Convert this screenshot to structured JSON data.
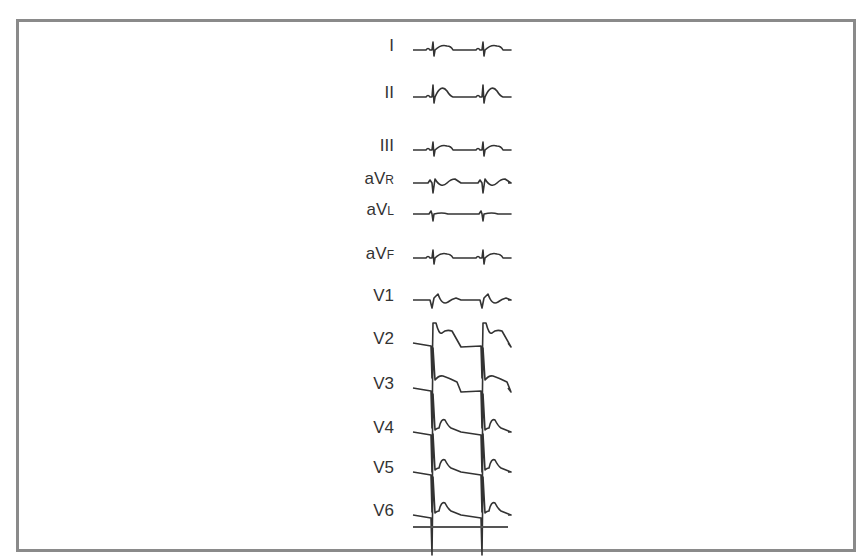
{
  "figure": {
    "type": "12-lead ECG",
    "leads": [
      {
        "id": "I",
        "main": "I",
        "sub": "",
        "baseline_y": 50,
        "morph": "upright_small"
      },
      {
        "id": "II",
        "main": "II",
        "sub": "",
        "baseline_y": 97,
        "morph": "upright_peakT"
      },
      {
        "id": "III",
        "main": "III",
        "sub": "",
        "baseline_y": 150,
        "morph": "upright_small"
      },
      {
        "id": "aVR",
        "main": "aV",
        "sub": "R",
        "baseline_y": 183,
        "morph": "inverted"
      },
      {
        "id": "aVL",
        "main": "aV",
        "sub": "L",
        "baseline_y": 214,
        "morph": "flat"
      },
      {
        "id": "aVF",
        "main": "aV",
        "sub": "F",
        "baseline_y": 258,
        "morph": "upright_small"
      },
      {
        "id": "V1",
        "main": "V1",
        "sub": "",
        "baseline_y": 300,
        "morph": "v1"
      },
      {
        "id": "V2",
        "main": "V2",
        "sub": "",
        "baseline_y": 343,
        "morph": "v2"
      },
      {
        "id": "V3",
        "main": "V3",
        "sub": "",
        "baseline_y": 388,
        "morph": "v3"
      },
      {
        "id": "V4",
        "main": "V4",
        "sub": "",
        "baseline_y": 432,
        "morph": "vT"
      },
      {
        "id": "V5",
        "main": "V5",
        "sub": "",
        "baseline_y": 472,
        "morph": "vT"
      },
      {
        "id": "V6",
        "main": "V6",
        "sub": "",
        "baseline_y": 515,
        "morph": "vT"
      }
    ],
    "trace": {
      "x_start": 413,
      "x_end": 508,
      "beat1_x": 432,
      "beat2_x": 482,
      "color": "#333333"
    },
    "calibration_line": {
      "y": 527,
      "x_start": 413,
      "x_end": 508
    }
  }
}
